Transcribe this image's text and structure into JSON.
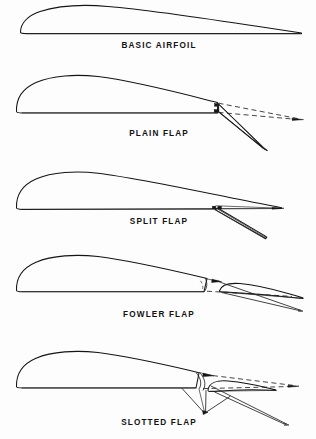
{
  "figure": {
    "background_color": "#fdfdfd",
    "line_color": "#141414",
    "panel_count": 5
  },
  "panels": [
    {
      "id": "basic-airfoil",
      "label": "BASIC AIRFOIL",
      "label_x": 159,
      "label_y": 48,
      "description": "Plain airfoil section with no flap, rounded leading edge and sharp trailing edge",
      "has_flap": false,
      "has_dashed_reference": false
    },
    {
      "id": "plain-flap",
      "label": "PLAIN FLAP",
      "label_x": 159,
      "label_y": 136,
      "description": "Trailing edge hinged downward about a fixed hinge point, dashed line shows retracted position",
      "has_flap": true,
      "has_dashed_reference": true,
      "hinge_x": 218,
      "hinge_y": 112
    },
    {
      "id": "split-flap",
      "label": "SPLIT FLAP",
      "label_x": 159,
      "label_y": 224,
      "description": "Lower surface panel deflects downward while upper surface trailing edge remains fixed",
      "has_flap": true,
      "has_dashed_reference": false,
      "hinge_x": 216,
      "hinge_y": 209
    },
    {
      "id": "fowler-flap",
      "label": "FOWLER FLAP",
      "label_x": 159,
      "label_y": 317,
      "description": "Flap translates aft and downward on tracks forming a slot and increasing wing area",
      "has_flap": true,
      "has_dashed_reference": true,
      "hinge_x": 205,
      "hinge_y": 292
    },
    {
      "id": "slotted-flap",
      "label": "SLOTTED FLAP",
      "label_x": 159,
      "label_y": 425,
      "description": "Flap rotates down on an external linkage leaving a slot between wing and flap",
      "has_flap": true,
      "has_dashed_reference": true,
      "hinge_x": 196,
      "hinge_y": 388
    }
  ]
}
